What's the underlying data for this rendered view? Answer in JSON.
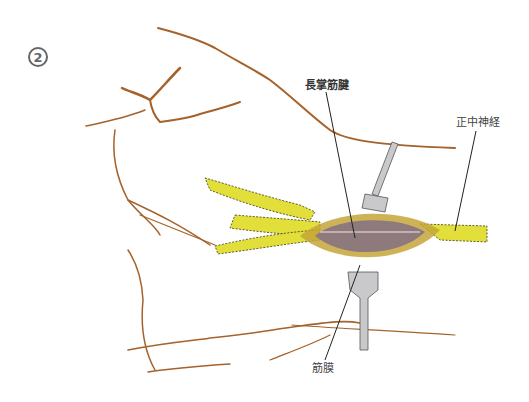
{
  "figure": {
    "step_number": "2",
    "labels": {
      "palmaris_longus_tendon": "長掌筋腱",
      "median_nerve": "正中神経",
      "fascia": "筋膜"
    }
  },
  "colors": {
    "skin_line": "#a5622a",
    "nerve": "#e3df3a",
    "nerve_dots": "#3a3a1a",
    "tendon": "#8e7a7c",
    "retractor": "#c9c9cc",
    "leader": "#222222",
    "badge": "#666666"
  }
}
